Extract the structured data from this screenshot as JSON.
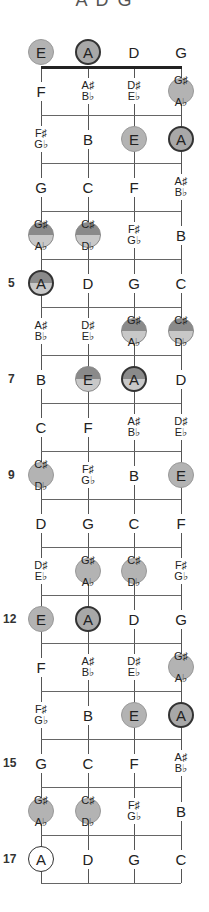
{
  "title": "A D G",
  "strings": [
    "E",
    "A",
    "D",
    "G"
  ],
  "fret_markers": [
    {
      "fret": 5,
      "label": "5"
    },
    {
      "fret": 7,
      "label": "7"
    },
    {
      "fret": 9,
      "label": "9"
    },
    {
      "fret": 12,
      "label": "12"
    },
    {
      "fret": 15,
      "label": "15"
    },
    {
      "fret": 17,
      "label": "17"
    }
  ],
  "rows": [
    {
      "fret": 0,
      "cells": [
        {
          "n": "E",
          "style": "light"
        },
        {
          "n": "A",
          "style": "dark"
        },
        {
          "n": "D"
        },
        {
          "n": "G"
        }
      ]
    },
    {
      "fret": 1,
      "cells": [
        {
          "n": "F"
        },
        {
          "n": "A♯",
          "n2": "B♭"
        },
        {
          "n": "D♯",
          "n2": "E♭"
        },
        {
          "n": "G♯",
          "n2": "A♭",
          "style": "light"
        }
      ]
    },
    {
      "fret": 2,
      "cells": [
        {
          "n": "F♯",
          "n2": "G♭"
        },
        {
          "n": "B"
        },
        {
          "n": "E",
          "style": "light"
        },
        {
          "n": "A",
          "style": "dark"
        }
      ]
    },
    {
      "fret": 3,
      "cells": [
        {
          "n": "G"
        },
        {
          "n": "C"
        },
        {
          "n": "F"
        },
        {
          "n": "A♯",
          "n2": "B♭"
        }
      ]
    },
    {
      "fret": 4,
      "cells": [
        {
          "n": "G♯",
          "n2": "A♭",
          "style": "split"
        },
        {
          "n": "C♯",
          "n2": "D♭",
          "style": "split"
        },
        {
          "n": "F♯",
          "n2": "G♭"
        },
        {
          "n": "B"
        }
      ]
    },
    {
      "fret": 5,
      "cells": [
        {
          "n": "A",
          "style": "splitdark"
        },
        {
          "n": "D"
        },
        {
          "n": "G"
        },
        {
          "n": "C"
        }
      ]
    },
    {
      "fret": 6,
      "cells": [
        {
          "n": "A♯",
          "n2": "B♭"
        },
        {
          "n": "D♯",
          "n2": "E♭"
        },
        {
          "n": "G♯",
          "n2": "A♭",
          "style": "split"
        },
        {
          "n": "C♯",
          "n2": "D♭",
          "style": "split"
        }
      ]
    },
    {
      "fret": 7,
      "cells": [
        {
          "n": "B"
        },
        {
          "n": "E",
          "style": "split"
        },
        {
          "n": "A",
          "style": "splitdark"
        },
        {
          "n": "D"
        }
      ]
    },
    {
      "fret": 8,
      "cells": [
        {
          "n": "C"
        },
        {
          "n": "F"
        },
        {
          "n": "A♯",
          "n2": "B♭"
        },
        {
          "n": "D♯",
          "n2": "E♭"
        }
      ]
    },
    {
      "fret": 9,
      "cells": [
        {
          "n": "C♯",
          "n2": "D♭",
          "style": "light"
        },
        {
          "n": "F♯",
          "n2": "G♭"
        },
        {
          "n": "B"
        },
        {
          "n": "E",
          "style": "light"
        }
      ]
    },
    {
      "fret": 10,
      "cells": [
        {
          "n": "D"
        },
        {
          "n": "G"
        },
        {
          "n": "C"
        },
        {
          "n": "F"
        }
      ]
    },
    {
      "fret": 11,
      "cells": [
        {
          "n": "D♯",
          "n2": "E♭"
        },
        {
          "n": "G♯",
          "n2": "A♭",
          "style": "light"
        },
        {
          "n": "C♯",
          "n2": "D♭",
          "style": "light"
        },
        {
          "n": "F♯",
          "n2": "G♭"
        }
      ]
    },
    {
      "fret": 12,
      "cells": [
        {
          "n": "E",
          "style": "light"
        },
        {
          "n": "A",
          "style": "dark"
        },
        {
          "n": "D"
        },
        {
          "n": "G"
        }
      ]
    },
    {
      "fret": 13,
      "cells": [
        {
          "n": "F"
        },
        {
          "n": "A♯",
          "n2": "B♭"
        },
        {
          "n": "D♯",
          "n2": "E♭"
        },
        {
          "n": "G♯",
          "n2": "A♭",
          "style": "light"
        }
      ]
    },
    {
      "fret": 14,
      "cells": [
        {
          "n": "F♯",
          "n2": "G♭"
        },
        {
          "n": "B"
        },
        {
          "n": "E",
          "style": "light"
        },
        {
          "n": "A",
          "style": "dark"
        }
      ]
    },
    {
      "fret": 15,
      "cells": [
        {
          "n": "G"
        },
        {
          "n": "C"
        },
        {
          "n": "F"
        },
        {
          "n": "A♯",
          "n2": "B♭"
        }
      ]
    },
    {
      "fret": 16,
      "cells": [
        {
          "n": "G♯",
          "n2": "A♭",
          "style": "light"
        },
        {
          "n": "C♯",
          "n2": "D♭",
          "style": "light"
        },
        {
          "n": "F♯",
          "n2": "G♭"
        },
        {
          "n": "B"
        }
      ]
    },
    {
      "fret": 17,
      "cells": [
        {
          "n": "A",
          "style": "white"
        },
        {
          "n": "D"
        },
        {
          "n": "G"
        },
        {
          "n": "C"
        }
      ]
    }
  ],
  "colors": {
    "light_fill": "#b3b3b3",
    "split_top": "#8a8a8a",
    "split_bottom": "#c8c8c8",
    "outline_dark": "#333333",
    "line": "#666666"
  }
}
